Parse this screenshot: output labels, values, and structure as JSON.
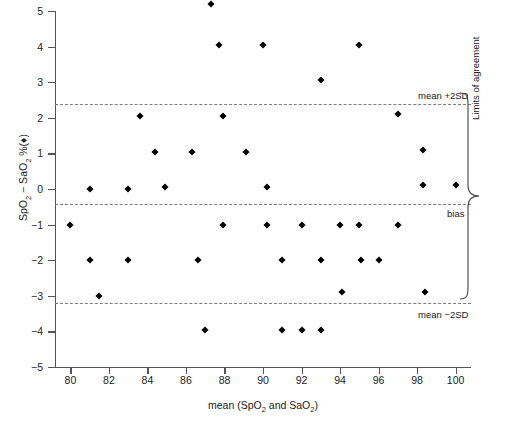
{
  "chart_data": {
    "type": "scatter",
    "title": "",
    "xlabel": "mean (SpO2 and SaO2)",
    "ylabel": "SpO2 - SaO2 %",
    "xlim": [
      79.2,
      100.8
    ],
    "ylim": [
      -5,
      5
    ],
    "xticks": [
      80,
      82,
      84,
      86,
      88,
      90,
      92,
      94,
      96,
      98,
      100
    ],
    "yticks": [
      -5,
      -4,
      -3,
      -2,
      -1,
      0,
      1,
      2,
      3,
      4,
      5
    ],
    "grid": false,
    "legend": "none",
    "marker": "diamond",
    "marker_color": "#000000",
    "series": [
      {
        "name": "SpO2 minus SaO2 difference",
        "points": [
          [
            80.0,
            -1.0
          ],
          [
            81.0,
            0.0
          ],
          [
            81.0,
            -2.0
          ],
          [
            81.5,
            -3.0
          ],
          [
            83.0,
            0.0
          ],
          [
            83.0,
            -2.0
          ],
          [
            83.6,
            2.05
          ],
          [
            84.4,
            1.05
          ],
          [
            84.9,
            0.05
          ],
          [
            86.3,
            1.05
          ],
          [
            86.6,
            -2.0
          ],
          [
            87.0,
            -3.95
          ],
          [
            87.3,
            5.2
          ],
          [
            87.7,
            4.05
          ],
          [
            87.9,
            2.05
          ],
          [
            87.9,
            -1.0
          ],
          [
            89.1,
            1.05
          ],
          [
            90.0,
            4.05
          ],
          [
            90.2,
            0.05
          ],
          [
            90.2,
            -1.0
          ],
          [
            91.0,
            -2.0
          ],
          [
            91.0,
            -3.95
          ],
          [
            92.0,
            -1.0
          ],
          [
            92.0,
            -3.95
          ],
          [
            93.0,
            3.05
          ],
          [
            93.0,
            -2.0
          ],
          [
            93.0,
            -3.95
          ],
          [
            94.0,
            -1.0
          ],
          [
            94.1,
            -2.9
          ],
          [
            95.0,
            4.05
          ],
          [
            95.0,
            -1.0
          ],
          [
            95.1,
            -2.0
          ],
          [
            96.0,
            -2.0
          ],
          [
            97.0,
            2.1
          ],
          [
            97.0,
            -1.0
          ],
          [
            98.3,
            1.1
          ],
          [
            98.3,
            0.1
          ],
          [
            98.4,
            -2.9
          ],
          [
            100.0,
            0.1
          ]
        ]
      }
    ],
    "reference_lines": [
      {
        "id": "upper",
        "label": "mean +2SD",
        "value": 2.38
      },
      {
        "id": "bias",
        "label": "bias",
        "value": -0.42
      },
      {
        "id": "lower",
        "label": "mean -2SD",
        "value": -3.2
      }
    ],
    "brace_annotation": "Limits of agreement"
  },
  "axis": {
    "y_label_prefix": "SpO",
    "y_label_sub1": "2",
    "y_label_mid": " − SaO",
    "y_label_sub2": "2",
    "y_label_suffix": " %(♦)",
    "x_label_prefix": "mean (SpO",
    "x_label_sub1": "2",
    "x_label_mid": " and SaO",
    "x_label_sub2": "2",
    "x_label_suffix": ")"
  },
  "annotations": {
    "upper_label": "mean +2SD",
    "bias_label": "bias",
    "lower_label": "mean −2SD",
    "brace_label": "Limits of agreement"
  }
}
